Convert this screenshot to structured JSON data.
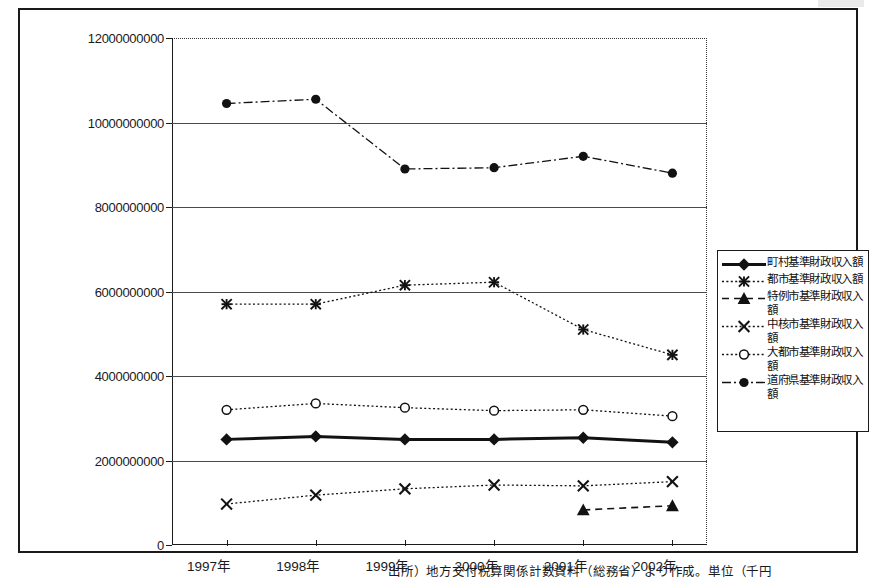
{
  "chart_data": {
    "type": "line",
    "title": "",
    "xlabel": "",
    "ylabel": "",
    "grid": true,
    "legend_position": "right",
    "categories": [
      "1997年",
      "1998年",
      "1999年",
      "2000年",
      "2001年",
      "2002年"
    ],
    "ylim": [
      0,
      12000000000
    ],
    "ytick_values": [
      0,
      2000000000,
      4000000000,
      6000000000,
      8000000000,
      10000000000,
      12000000000
    ],
    "ytick_labels": [
      "0",
      "2000000000",
      "4000000000",
      "6000000000",
      "8000000000",
      "10000000000",
      "12000000000"
    ],
    "series": [
      {
        "name": "町村基準財政収入額",
        "marker": "filled-diamond",
        "line_style": "solid-thick",
        "values": [
          2500000000,
          2570000000,
          2500000000,
          2500000000,
          2540000000,
          2430000000
        ]
      },
      {
        "name": "都市基準財政収入額",
        "marker": "star-asterisk",
        "line_style": "dotted",
        "values": [
          5700000000,
          5700000000,
          6150000000,
          6220000000,
          5100000000,
          4500000000
        ]
      },
      {
        "name": "特例市基準財政収入額",
        "marker": "filled-triangle",
        "line_style": "dashed",
        "values": [
          null,
          null,
          null,
          null,
          830000000,
          930000000
        ]
      },
      {
        "name": "中核市基準財政収入額",
        "marker": "x-cross",
        "line_style": "dotted",
        "values": [
          970000000,
          1180000000,
          1330000000,
          1420000000,
          1400000000,
          1500000000
        ]
      },
      {
        "name": "大都市基準財政収入額",
        "marker": "open-circle",
        "line_style": "dotted",
        "values": [
          3200000000,
          3350000000,
          3250000000,
          3180000000,
          3200000000,
          3050000000
        ]
      },
      {
        "name": "道府県基準財政収入額",
        "marker": "filled-circle",
        "line_style": "dash-dot",
        "values": [
          10450000000,
          10550000000,
          8900000000,
          8930000000,
          9200000000,
          8800000000
        ]
      }
    ]
  },
  "caption": {
    "source_note": "出所）地方交付税算関係計数資料（総務省）より作成。単位（千円"
  },
  "colors": {
    "ink": "#1a1a1a",
    "grid": "#4a4a4a",
    "paper": "#ffffff"
  }
}
